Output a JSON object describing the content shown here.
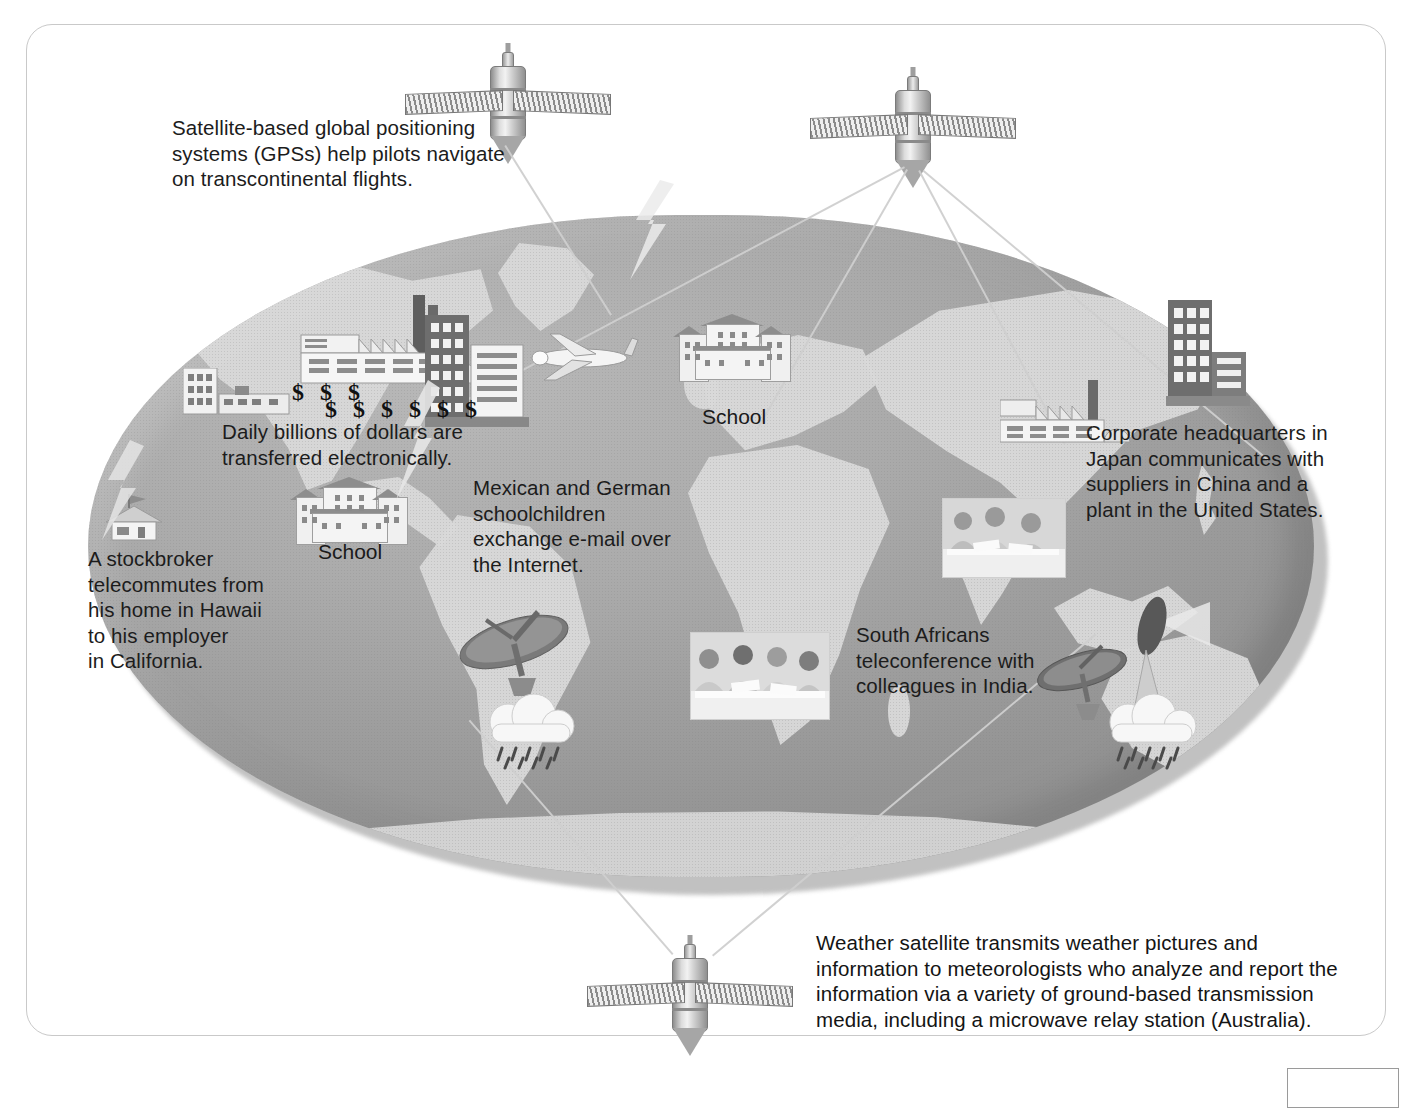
{
  "figure": {
    "type": "illustration-diagram"
  },
  "captions": {
    "gps": "Satellite-based global positioning systems (GPSs) help pilots navigate on transcontinental flights.",
    "gps_lines": [
      "Satellite-based global positioning",
      "systems (GPSs) help pilots navigate",
      "on transcontinental flights."
    ],
    "money": "Daily billions of dollars are transferred electronically.",
    "money_lines": [
      "Daily billions of dollars are",
      "transferred electronically."
    ],
    "stockbroker": "A stockbroker telecommutes from his home in Hawaii to his employer in California.",
    "stockbroker_lines": [
      "A stockbroker",
      "telecommutes from",
      "his home in Hawaii",
      "to his employer",
      "in California."
    ],
    "email": "Mexican and German schoolchildren exchange e-mail over the Internet.",
    "email_lines": [
      "Mexican and German",
      "schoolchildren",
      "exchange e-mail over",
      "the Internet."
    ],
    "corporate": "Corporate headquarters in Japan communicates with suppliers in China and a plant in the United States.",
    "corporate_lines": [
      "Corporate headquarters in",
      "Japan communicates with",
      "suppliers in China and a",
      "plant in the United States."
    ],
    "teleconference": "South Africans teleconference with colleagues in India.",
    "teleconference_lines": [
      "South Africans",
      "teleconference with",
      "colleagues in India."
    ],
    "weather": "Weather satellite transmits weather pictures and information to meteorologists who analyze and report the information via a variety of ground-based transmission media, including a microwave relay station (Australia).",
    "weather_lines": [
      "Weather satellite transmits weather pictures and",
      "information to meteorologists who analyze and report the",
      "information via a variety of ground-based transmission",
      "media, including a microwave relay station (Australia)."
    ]
  },
  "map_labels": {
    "school_europe": "School",
    "school_mexico": "School"
  },
  "money_symbols": {
    "row1": "$ $ $",
    "row2": "$ $ $ $ $ $"
  },
  "icons": {
    "satellite_gps": "satellite-icon",
    "satellite_comm": "satellite-icon",
    "satellite_weather": "weather-satellite-icon",
    "airplane": "airplane-icon",
    "factory": "factory-icon",
    "office_tower": "office-building-icon",
    "school": "school-building-icon",
    "house": "house-icon",
    "satellite_dish": "satellite-dish-icon",
    "microwave_relay": "microwave-relay-tower-icon",
    "rain_cloud": "rain-cloud-icon",
    "teleconference_photo": "teleconference-photo-icon"
  },
  "colors": {
    "globe_fill": "#a8a8a8",
    "land_fill": "#d9d9d9",
    "text": "#1a1a1a",
    "frame": "#c9c9c9",
    "beam": "#d5d5d5"
  }
}
